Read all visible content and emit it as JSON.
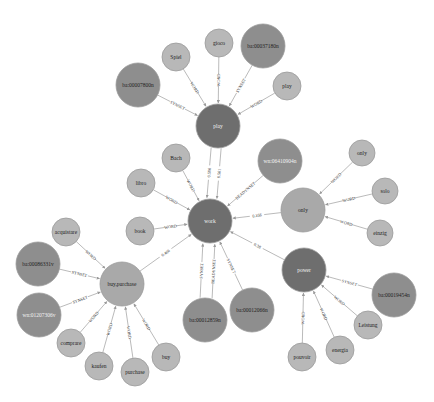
{
  "colors": {
    "hub_dark": "#6e6e6e",
    "synset_mid": "#8e8e8e",
    "word_light": "#b8b8b8",
    "node_stroke": "#9a9a9a",
    "edge": "#a8a8a8",
    "label_dark_text": "#222222",
    "label_light_text": "#f2f2f2"
  },
  "nodes": [
    {
      "id": "work",
      "label": "work",
      "x": 210,
      "y": 221,
      "r": 22,
      "kind": "hub"
    },
    {
      "id": "play",
      "label": "play",
      "x": 218,
      "y": 126,
      "r": 22,
      "kind": "hub"
    },
    {
      "id": "power",
      "label": "power",
      "x": 304,
      "y": 270,
      "r": 22,
      "kind": "hub"
    },
    {
      "id": "only",
      "label": "only",
      "x": 303,
      "y": 210,
      "r": 22,
      "kind": "word-big"
    },
    {
      "id": "buy_purchase",
      "label": "buy,purchase",
      "x": 122,
      "y": 284,
      "r": 22,
      "kind": "word-big"
    },
    {
      "id": "ba00007800n",
      "label": "ba:00007800n",
      "x": 138,
      "y": 85,
      "r": 22,
      "kind": "synset"
    },
    {
      "id": "ba00037180n",
      "label": "ba:00037180n",
      "x": 263,
      "y": 46,
      "r": 22,
      "kind": "synset"
    },
    {
      "id": "wn06410904n",
      "label": "wn:06410904n",
      "x": 280,
      "y": 161,
      "r": 22,
      "kind": "synset"
    },
    {
      "id": "ba00086331v",
      "label": "ba:00086331v",
      "x": 38,
      "y": 264,
      "r": 22,
      "kind": "synset"
    },
    {
      "id": "wn01207306v",
      "label": "wn:01207306v",
      "x": 39,
      "y": 315,
      "r": 22,
      "kind": "synset"
    },
    {
      "id": "ba00012859n",
      "label": "ba:00012859n",
      "x": 205,
      "y": 320,
      "r": 22,
      "kind": "synset"
    },
    {
      "id": "ba00012066n",
      "label": "ba:00012066n",
      "x": 252,
      "y": 310,
      "r": 22,
      "kind": "synset"
    },
    {
      "id": "ba00019454n",
      "label": "ba:00019454n",
      "x": 394,
      "y": 295,
      "r": 22,
      "kind": "synset"
    },
    {
      "id": "spiel",
      "label": "Spiel",
      "x": 176,
      "y": 57,
      "r": 14,
      "kind": "word"
    },
    {
      "id": "gioco",
      "label": "gioco",
      "x": 219,
      "y": 43,
      "r": 14,
      "kind": "word"
    },
    {
      "id": "play_word",
      "label": "play",
      "x": 287,
      "y": 86,
      "r": 14,
      "kind": "word"
    },
    {
      "id": "bach",
      "label": "Bach",
      "x": 176,
      "y": 158,
      "r": 14,
      "kind": "word"
    },
    {
      "id": "libro",
      "label": "libro",
      "x": 141,
      "y": 183,
      "r": 14,
      "kind": "word"
    },
    {
      "id": "book",
      "label": "book",
      "x": 140,
      "y": 231,
      "r": 14,
      "kind": "word"
    },
    {
      "id": "only_word",
      "label": "only",
      "x": 362,
      "y": 153,
      "r": 13,
      "kind": "word"
    },
    {
      "id": "solo",
      "label": "solo",
      "x": 385,
      "y": 191,
      "r": 13,
      "kind": "word"
    },
    {
      "id": "einzig",
      "label": "einzig",
      "x": 380,
      "y": 233,
      "r": 13,
      "kind": "word"
    },
    {
      "id": "acquistare",
      "label": "acquistare",
      "x": 66,
      "y": 232,
      "r": 14,
      "kind": "word"
    },
    {
      "id": "comprare",
      "label": "comprare",
      "x": 71,
      "y": 343,
      "r": 14,
      "kind": "word"
    },
    {
      "id": "kaufen",
      "label": "kaufen",
      "x": 99,
      "y": 366,
      "r": 14,
      "kind": "word"
    },
    {
      "id": "purchase",
      "label": "purchase",
      "x": 135,
      "y": 372,
      "r": 14,
      "kind": "word"
    },
    {
      "id": "buy",
      "label": "buy",
      "x": 166,
      "y": 357,
      "r": 14,
      "kind": "word"
    },
    {
      "id": "leistung",
      "label": "Leistung",
      "x": 368,
      "y": 325,
      "r": 14,
      "kind": "word"
    },
    {
      "id": "energia",
      "label": "energia",
      "x": 340,
      "y": 350,
      "r": 14,
      "kind": "word"
    },
    {
      "id": "pouvoir",
      "label": "pouvoir",
      "x": 302,
      "y": 357,
      "r": 14,
      "kind": "word"
    }
  ],
  "edges": [
    {
      "source": "ba00007800n",
      "target": "play",
      "label": "SYNSET"
    },
    {
      "source": "spiel",
      "target": "play",
      "label": "WORD"
    },
    {
      "source": "gioco",
      "target": "play",
      "label": "WORD"
    },
    {
      "source": "ba00037180n",
      "target": "play",
      "label": "SYNSET"
    },
    {
      "source": "play_word",
      "target": "play",
      "label": "WORD"
    },
    {
      "source": "play",
      "target": "work",
      "label": "0.561",
      "offset": -5
    },
    {
      "source": "play",
      "target": "work",
      "label": "0.506",
      "offset": 5
    },
    {
      "source": "bach",
      "target": "work",
      "label": "WORD"
    },
    {
      "source": "libro",
      "target": "work",
      "label": "WORD"
    },
    {
      "source": "book",
      "target": "work",
      "label": "WORD"
    },
    {
      "source": "wn06410904n",
      "target": "work",
      "label": "BEADYNSET"
    },
    {
      "source": "only",
      "target": "work",
      "label": "0.356"
    },
    {
      "source": "power",
      "target": "work",
      "label": "0.38"
    },
    {
      "source": "buy_purchase",
      "target": "work",
      "label": "0.466"
    },
    {
      "source": "ba00012859n",
      "target": "work",
      "label": "SYNSET",
      "offset": -6
    },
    {
      "source": "ba00012859n",
      "target": "work",
      "label": "BEADYNSET",
      "offset": 6
    },
    {
      "source": "ba00012066n",
      "target": "work",
      "label": "SYNSET"
    },
    {
      "source": "only_word",
      "target": "only",
      "label": "WORD"
    },
    {
      "source": "solo",
      "target": "only",
      "label": "WORD"
    },
    {
      "source": "einzig",
      "target": "only",
      "label": "WORD"
    },
    {
      "source": "acquistare",
      "target": "buy_purchase",
      "label": "WORD"
    },
    {
      "source": "ba00086331v",
      "target": "buy_purchase",
      "label": "SYNSET"
    },
    {
      "source": "wn01207306v",
      "target": "buy_purchase",
      "label": "SYNSET"
    },
    {
      "source": "comprare",
      "target": "buy_purchase",
      "label": "WORD"
    },
    {
      "source": "kaufen",
      "target": "buy_purchase",
      "label": "WORD"
    },
    {
      "source": "purchase",
      "target": "buy_purchase",
      "label": "WORD"
    },
    {
      "source": "buy",
      "target": "buy_purchase",
      "label": "WORD"
    },
    {
      "source": "ba00019454n",
      "target": "power",
      "label": "SYNSET"
    },
    {
      "source": "leistung",
      "target": "power",
      "label": "WORD"
    },
    {
      "source": "energia",
      "target": "power",
      "label": "WORD"
    },
    {
      "source": "pouvoir",
      "target": "power",
      "label": "WORD"
    }
  ]
}
